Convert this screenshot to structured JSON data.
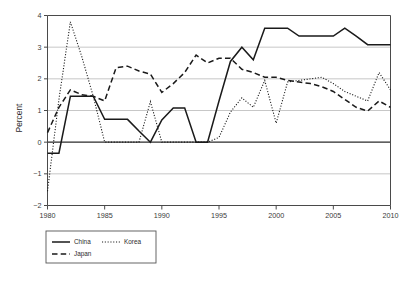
{
  "chart_data": {
    "type": "line",
    "title": "",
    "xlabel": "",
    "ylabel": "Percent",
    "xlim": [
      1980,
      2010
    ],
    "ylim": [
      -2,
      4
    ],
    "grid": true,
    "legend_position": "below-left",
    "x": [
      1980,
      1981,
      1982,
      1983,
      1984,
      1985,
      1986,
      1987,
      1988,
      1989,
      1990,
      1991,
      1992,
      1993,
      1994,
      1995,
      1996,
      1997,
      1998,
      1999,
      2000,
      2001,
      2002,
      2003,
      2004,
      2005,
      2006,
      2007,
      2008,
      2009,
      2010
    ],
    "xticks": [
      1980,
      1985,
      1990,
      1995,
      2000,
      2005,
      2010
    ],
    "xticklabels": [
      "1980",
      "1985",
      "1990",
      "1995",
      "2000",
      "2005",
      "2010"
    ],
    "yticks": [
      -2,
      -1,
      0,
      1,
      2,
      3,
      4
    ],
    "yticklabels": [
      "−2",
      "−1",
      "0",
      "1",
      "2",
      "3",
      "4"
    ],
    "series": [
      {
        "name": "China",
        "style": "solid",
        "values": [
          -0.35,
          -0.35,
          1.45,
          1.45,
          1.45,
          0.72,
          0.72,
          0.72,
          0.35,
          0.0,
          0.7,
          1.08,
          1.08,
          0.0,
          0.0,
          1.3,
          2.55,
          3.0,
          2.6,
          3.6,
          3.6,
          3.6,
          3.35,
          3.35,
          3.35,
          3.35,
          3.6,
          3.35,
          3.08,
          3.08,
          3.08
        ]
      },
      {
        "name": "Japan",
        "style": "dashed",
        "values": [
          0.3,
          1.1,
          1.65,
          1.5,
          1.45,
          1.3,
          2.35,
          2.4,
          2.25,
          2.15,
          1.57,
          1.85,
          2.2,
          2.75,
          2.5,
          2.65,
          2.65,
          2.3,
          2.2,
          2.05,
          2.05,
          1.95,
          1.9,
          1.85,
          1.75,
          1.6,
          1.35,
          1.1,
          0.98,
          1.3,
          1.1
        ]
      },
      {
        "name": "Korea",
        "style": "dotted",
        "values": [
          -1.55,
          1.35,
          3.8,
          2.7,
          1.45,
          0.0,
          0.0,
          0.0,
          0.0,
          1.28,
          0.0,
          0.0,
          0.0,
          0.0,
          0.0,
          0.15,
          0.95,
          1.4,
          1.1,
          1.95,
          0.6,
          1.9,
          1.95,
          2.0,
          2.05,
          1.85,
          1.6,
          1.45,
          1.3,
          2.2,
          1.65
        ]
      }
    ]
  },
  "legend": {
    "entries": [
      {
        "label": "China",
        "style": "solid"
      },
      {
        "label": "Korea",
        "style": "dotted"
      },
      {
        "label": "Japan",
        "style": "dashed"
      }
    ]
  }
}
